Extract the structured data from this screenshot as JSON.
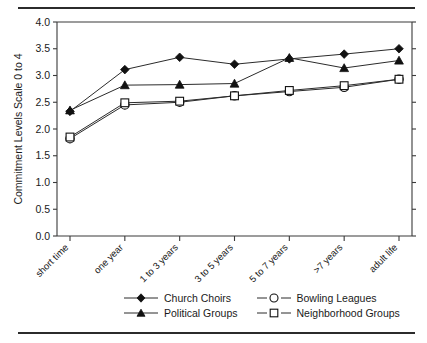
{
  "chart_data": {
    "type": "line",
    "title": "",
    "xlabel": "",
    "ylabel": "Commitment Levels Scale 0 to 4",
    "ylim": [
      0.0,
      4.0
    ],
    "ytick_labels": [
      "0.0",
      "0.5",
      "1.0",
      "1.5",
      "2.0",
      "2.5",
      "3.0",
      "3.5",
      "4.0"
    ],
    "ytick_values": [
      0.0,
      0.5,
      1.0,
      1.5,
      2.0,
      2.5,
      3.0,
      3.5,
      4.0
    ],
    "grid": false,
    "legend_position": "below",
    "categories": [
      "short time",
      "one year",
      "1 to 3 years",
      "3 to 5 years",
      "5 to 7 years",
      ">7 years",
      "adult life"
    ],
    "series": [
      {
        "name": "Church Choirs",
        "marker": "filled-diamond",
        "values": [
          2.33,
          3.11,
          3.34,
          3.21,
          3.31,
          3.4,
          3.5
        ]
      },
      {
        "name": "Political Groups",
        "marker": "filled-triangle",
        "values": [
          2.35,
          2.82,
          2.83,
          2.85,
          3.33,
          3.14,
          3.28
        ]
      },
      {
        "name": "Bowling Leagues",
        "marker": "open-circle",
        "values": [
          1.82,
          2.45,
          2.5,
          2.62,
          2.7,
          2.78,
          2.93
        ]
      },
      {
        "name": "Neighborhood Groups",
        "marker": "open-square",
        "values": [
          1.85,
          2.49,
          2.52,
          2.62,
          2.72,
          2.81,
          2.93
        ]
      }
    ]
  },
  "legend": {
    "entries": [
      {
        "label": "Church Choirs",
        "marker": "filled-diamond"
      },
      {
        "label": "Bowling Leagues",
        "marker": "open-circle"
      },
      {
        "label": "Political Groups",
        "marker": "filled-triangle"
      },
      {
        "label": "Neighborhood Groups",
        "marker": "open-square"
      }
    ]
  },
  "colors": {
    "ink": "#1a1a1a",
    "line": "#2b2b2b",
    "marker_fill": "#111111",
    "marker_open": "#ffffff"
  }
}
